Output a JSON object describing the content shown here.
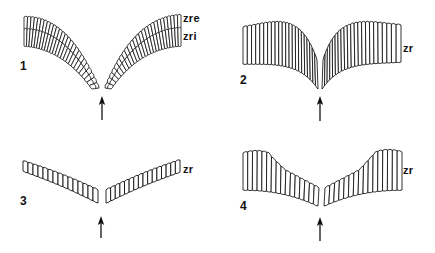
{
  "figure": {
    "type": "scientific line-drawing diagram",
    "stroke_color": "#111111",
    "background": "#ffffff",
    "panels": [
      {
        "id": "1",
        "number_label": "1",
        "zone_labels": [
          "zre",
          "zri"
        ],
        "shape": "deep V, two-layered rows of narrow cells curving down to a central gap",
        "arrow": "upward arrow below the central gap"
      },
      {
        "id": "2",
        "number_label": "2",
        "zone_labels": [
          "zr"
        ],
        "shape": "wide band of tall cells dipping to a narrow V at the center",
        "arrow": "upward arrow below the central gap"
      },
      {
        "id": "3",
        "number_label": "3",
        "zone_labels": [
          "zr"
        ],
        "shape": "shallow V, single thin row of small cells",
        "arrow": "upward arrow below the central gap"
      },
      {
        "id": "4",
        "number_label": "4",
        "zone_labels": [
          "zr"
        ],
        "shape": "stepped band, tall cells at ends shortening toward the center",
        "arrow": "upward arrow below the central gap"
      }
    ]
  }
}
